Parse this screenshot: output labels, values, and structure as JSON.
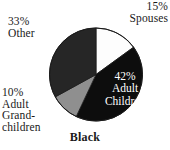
{
  "caption": "Black",
  "colors": {
    "background": "#ffffff",
    "text": "#1a1a1a",
    "inside_label_text": "#ffffff",
    "spouses": "#fdfdfd",
    "adult_children": "#0d0d0d",
    "adult_grandchildren": "#8f8f8f",
    "other": "#262626",
    "outline": "#1a1a1a"
  },
  "labels": {
    "spouses": {
      "pct": "15%",
      "name": "Spouses"
    },
    "adult_children": {
      "pct": "42%",
      "name_line1": "Adult",
      "name_line2": "Children"
    },
    "adult_grandchildren": {
      "pct": "10%",
      "name_line1": "Adult",
      "name_line2": "Grand-",
      "name_line3": "children"
    },
    "other": {
      "pct": "33%",
      "name": "Other"
    }
  },
  "chart_data": {
    "type": "pie",
    "title": "Black",
    "xlabel": "",
    "ylabel": "",
    "legend_position": "none",
    "grid": false,
    "labels_inside": [
      "Adult Children"
    ],
    "labels_outside": [
      "Spouses",
      "Other",
      "Adult Grandchildren"
    ],
    "start_angle_deg": 0,
    "direction": "clockwise",
    "units": "percent",
    "categories": [
      "Spouses",
      "Adult Children",
      "Adult Grandchildren",
      "Other"
    ],
    "values": [
      15,
      42,
      10,
      33
    ],
    "slices": [
      {
        "label": "Spouses",
        "value": 15,
        "display": "15%",
        "color": "#fdfdfd",
        "start_deg": 0.0,
        "end_deg": 54.0
      },
      {
        "label": "Adult Children",
        "value": 42,
        "display": "42%",
        "color": "#0d0d0d",
        "start_deg": 54.0,
        "end_deg": 205.2
      },
      {
        "label": "Adult Grandchildren",
        "value": 10,
        "display": "10%",
        "color": "#8f8f8f",
        "start_deg": 205.2,
        "end_deg": 241.2
      },
      {
        "label": "Other",
        "value": 33,
        "display": "33%",
        "color": "#262626",
        "start_deg": 241.2,
        "end_deg": 360.0
      }
    ],
    "total": 100
  }
}
